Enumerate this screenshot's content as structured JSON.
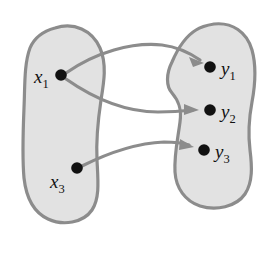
{
  "figure": {
    "colors": {
      "blob_fill": "#e2e2e2",
      "blob_stroke": "#8c8c8c",
      "arrow": "#8c8c8c",
      "dot": "#111111",
      "label": "#111111",
      "background": "#ffffff"
    }
  },
  "sets": [
    {
      "id": "domain-set",
      "name": "left-set",
      "nodes": [
        {
          "id": "x1",
          "label": "x",
          "subscript": "1",
          "cx": 61,
          "cy": 75,
          "label_x": 34,
          "label_y": 83
        },
        {
          "id": "x3",
          "label": "x",
          "subscript": "3",
          "cx": 77,
          "cy": 168,
          "label_x": 50,
          "label_y": 188
        }
      ]
    },
    {
      "id": "codomain-set",
      "name": "right-set",
      "nodes": [
        {
          "id": "y1",
          "label": "y",
          "subscript": "1",
          "cx": 210,
          "cy": 67,
          "label_x": 221,
          "label_y": 75
        },
        {
          "id": "y2",
          "label": "y",
          "subscript": "2",
          "cx": 210,
          "cy": 110,
          "label_x": 221,
          "label_y": 118
        },
        {
          "id": "y3",
          "label": "y",
          "subscript": "3",
          "cx": 204,
          "cy": 150,
          "label_x": 215,
          "label_y": 158
        }
      ]
    }
  ],
  "arrows": [
    {
      "id": "arrow-x1-y1",
      "from": "x1",
      "to": "y1",
      "name": "arrow-x1-to-y1"
    },
    {
      "id": "arrow-x1-y2",
      "from": "x1",
      "to": "y2",
      "name": "arrow-x1-to-y2"
    },
    {
      "id": "arrow-x3-y3",
      "from": "x3",
      "to": "y3",
      "name": "arrow-x3-to-y3"
    }
  ]
}
